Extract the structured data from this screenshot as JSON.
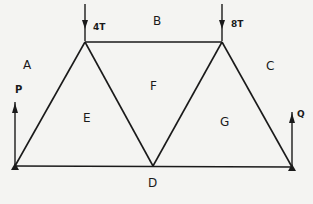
{
  "diagram": {
    "type": "truss",
    "loads": [
      {
        "label": "4T",
        "node": "top-left"
      },
      {
        "label": "8T",
        "node": "top-right"
      }
    ],
    "reactions": [
      {
        "label": "P",
        "node": "left-support"
      },
      {
        "label": "Q",
        "node": "right-support"
      }
    ],
    "regions": [
      "A",
      "B",
      "C",
      "D",
      "E",
      "F",
      "G"
    ],
    "colors": {
      "line": "#1a1a1a",
      "background": "#f4f4f2"
    }
  }
}
